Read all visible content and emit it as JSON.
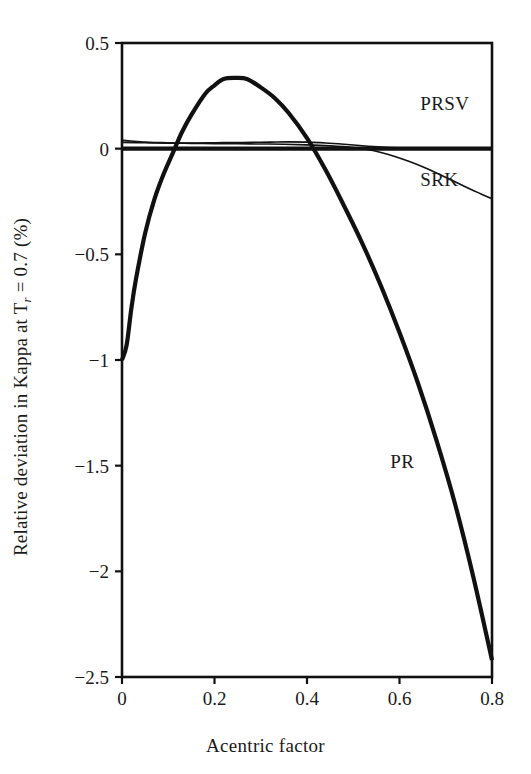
{
  "chart_data": {
    "type": "line",
    "title": "",
    "xlabel": "Acentric factor",
    "ylabel_text": "Relative deviation in Kappa at T",
    "ylabel_sub": "r",
    "ylabel_tail": " = 0.7 (%)",
    "ylabel_full": "Relative deviation in Kappa at T_r = 0.7 (%)",
    "xlim": [
      0,
      0.8
    ],
    "ylim": [
      -2.5,
      0.5
    ],
    "grid": false,
    "legend_position": "inline-annotations",
    "xticks": [
      {
        "value": 0,
        "label": "0"
      },
      {
        "value": 0.2,
        "label": "0.2"
      },
      {
        "value": 0.4,
        "label": "0.4"
      },
      {
        "value": 0.6,
        "label": "0.6"
      },
      {
        "value": 0.8,
        "label": "0.8"
      }
    ],
    "yticks": [
      {
        "value": 0.5,
        "label": "0.5"
      },
      {
        "value": 0,
        "label": "0"
      },
      {
        "value": -0.5,
        "label": "−0.5"
      },
      {
        "value": -1,
        "label": "−1"
      },
      {
        "value": -1.5,
        "label": "−1.5"
      },
      {
        "value": -2,
        "label": "−2"
      },
      {
        "value": -2.5,
        "label": "−2.5"
      }
    ],
    "series": [
      {
        "name": "PR",
        "label": "PR",
        "label_x": 0.58,
        "label_y": -1.48,
        "stroke_width": 4.2,
        "color": "#111111",
        "x": [
          0.0,
          0.01,
          0.02,
          0.03,
          0.05,
          0.07,
          0.09,
          0.11,
          0.13,
          0.15,
          0.18,
          0.2,
          0.22,
          0.245,
          0.27,
          0.3,
          0.33,
          0.36,
          0.4,
          0.44,
          0.48,
          0.52,
          0.56,
          0.6,
          0.64,
          0.68,
          0.72,
          0.76,
          0.8
        ],
        "y": [
          -1.0,
          -0.93,
          -0.76,
          -0.62,
          -0.4,
          -0.24,
          -0.12,
          -0.02,
          0.08,
          0.16,
          0.26,
          0.3,
          0.33,
          0.335,
          0.33,
          0.29,
          0.24,
          0.17,
          0.05,
          -0.1,
          -0.27,
          -0.45,
          -0.65,
          -0.87,
          -1.11,
          -1.38,
          -1.68,
          -2.03,
          -2.42
        ]
      },
      {
        "name": "PRSV",
        "label": "PRSV",
        "label_x": 0.645,
        "label_y": 0.215,
        "stroke_width": 1.6,
        "color": "#111111",
        "x": [
          0.0,
          0.02,
          0.05,
          0.08,
          0.12,
          0.16,
          0.2,
          0.24,
          0.28,
          0.32,
          0.36,
          0.4,
          0.44,
          0.48,
          0.52,
          0.56,
          0.6,
          0.65,
          0.7,
          0.75,
          0.8
        ],
        "y": [
          0.04,
          0.036,
          0.031,
          0.029,
          0.027,
          0.027,
          0.028,
          0.029,
          0.03,
          0.031,
          0.032,
          0.031,
          0.027,
          0.021,
          0.014,
          0.008,
          0.004,
          0.001,
          0.0,
          0.0,
          0.0
        ]
      },
      {
        "name": "SRK",
        "label": "SRK",
        "label_x": 0.645,
        "label_y": -0.145,
        "stroke_width": 1.6,
        "color": "#111111",
        "x": [
          0.0,
          0.05,
          0.1,
          0.15,
          0.2,
          0.25,
          0.3,
          0.35,
          0.4,
          0.45,
          0.5,
          0.53,
          0.56,
          0.59,
          0.62,
          0.65,
          0.68,
          0.71,
          0.74,
          0.77,
          0.8
        ],
        "y": [
          0.03,
          0.028,
          0.026,
          0.025,
          0.024,
          0.023,
          0.022,
          0.021,
          0.018,
          0.013,
          0.005,
          -0.004,
          -0.018,
          -0.037,
          -0.06,
          -0.086,
          -0.115,
          -0.146,
          -0.178,
          -0.208,
          -0.237
        ]
      },
      {
        "name": "zero-baseline",
        "label": "",
        "stroke_width": 4.2,
        "color": "#111111",
        "x": [
          0.0,
          0.8
        ],
        "y": [
          0.0,
          0.0
        ]
      }
    ],
    "axes": {
      "frame_color": "#111111",
      "frame_width": 2.6,
      "tick_length": 7
    }
  }
}
